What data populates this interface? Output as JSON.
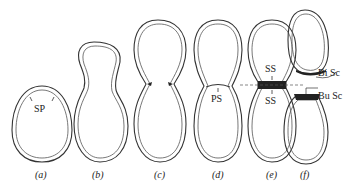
{
  "figure": {
    "panels": [
      {
        "id": "a",
        "label": "(a)",
        "annotations": [
          "SP"
        ]
      },
      {
        "id": "b",
        "label": "(b)",
        "annotations": []
      },
      {
        "id": "c",
        "label": "(c)",
        "annotations": []
      },
      {
        "id": "d",
        "label": "(d)",
        "annotations": [
          "PS"
        ]
      },
      {
        "id": "e",
        "label": "(e)",
        "annotations": [
          "SS",
          "SS"
        ]
      },
      {
        "id": "f",
        "label": "(f)",
        "annotations": [
          "Bi Sc",
          "Bu Sc"
        ]
      }
    ],
    "labels": {
      "sp": "SP",
      "ps": "PS",
      "ss_top": "SS",
      "ss_bottom": "SS",
      "bi_sc": "Bi Sc",
      "bu_sc": "Bu Sc"
    },
    "panel_labels": {
      "a": "(a)",
      "b": "(b)",
      "c": "(c)",
      "d": "(d)",
      "e": "(e)",
      "f": "(f)"
    }
  }
}
